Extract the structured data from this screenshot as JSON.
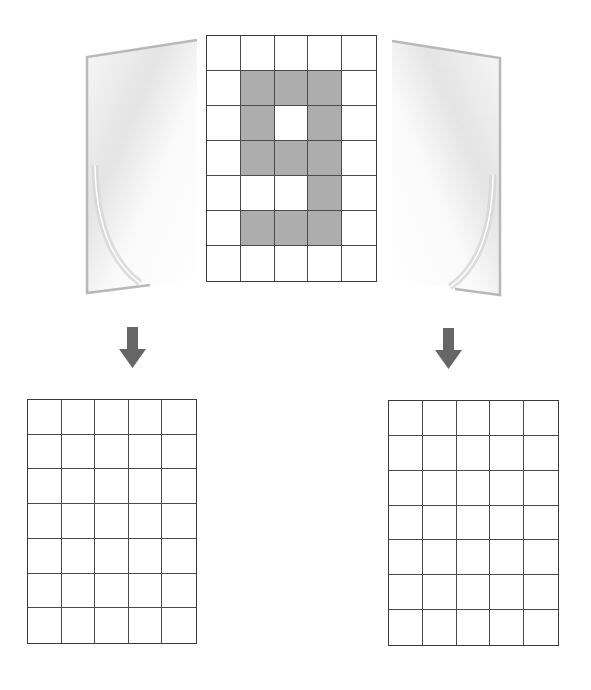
{
  "diagram": {
    "colors": {
      "background": "#ffffff",
      "grid_line": "#4a4a4a",
      "grid_border": "#3a3a3a",
      "shaded_cell": "#adadad",
      "arrow": "#666666",
      "flap_edge": "#b8b8b8",
      "flap_fill": "#f2f2f2"
    },
    "center_grid": {
      "columns": 5,
      "rows": 7,
      "filled_cells": [
        [
          1,
          1
        ],
        [
          1,
          2
        ],
        [
          1,
          3
        ],
        [
          2,
          1
        ],
        [
          2,
          3
        ],
        [
          3,
          1
        ],
        [
          3,
          2
        ],
        [
          3,
          3
        ],
        [
          4,
          3
        ],
        [
          5,
          1
        ],
        [
          5,
          2
        ],
        [
          5,
          3
        ]
      ],
      "pattern_shape": "digit 9"
    },
    "left_flap": {
      "icon": "left-folding-flap",
      "orientation": "left"
    },
    "right_flap": {
      "icon": "right-folding-flap",
      "orientation": "right"
    },
    "arrows": [
      {
        "icon": "arrow-down-icon",
        "position": "left"
      },
      {
        "icon": "arrow-down-icon",
        "position": "right"
      }
    ],
    "answer_grids": [
      {
        "position": "bottom-left",
        "columns": 5,
        "rows": 7,
        "filled_cells": []
      },
      {
        "position": "bottom-right",
        "columns": 5,
        "rows": 7,
        "filled_cells": []
      }
    ]
  }
}
